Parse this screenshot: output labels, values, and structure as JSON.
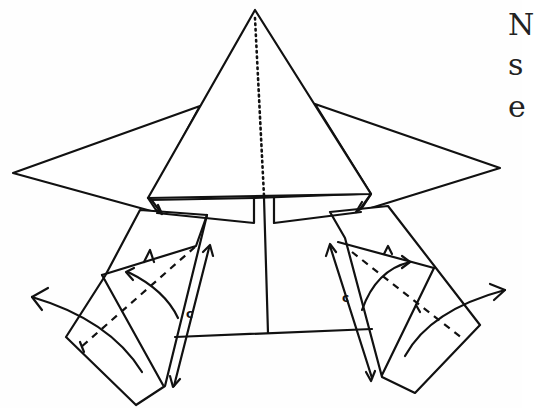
{
  "figure": {
    "type": "origami-diagram",
    "labels": {
      "left_length_marker": "c",
      "right_length_marker": "c"
    },
    "line_styles": {
      "solid": "edge",
      "dashed": "valley fold",
      "dotted": "center crease"
    },
    "colors": {
      "ink": "#111111",
      "paper": "#fefefe"
    }
  },
  "side_text": {
    "line1": "N",
    "line2": "s",
    "line3": "e"
  }
}
